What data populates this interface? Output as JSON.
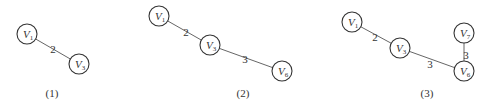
{
  "figures": [
    {
      "caption": "(1)",
      "caption_pos": [
        52,
        97
      ],
      "nodes": [
        {
          "id": "V1",
          "letter": "V",
          "sub": "1",
          "x": 27,
          "y": 34
        },
        {
          "id": "V3",
          "letter": "V",
          "sub": "3",
          "x": 79,
          "y": 64
        }
      ],
      "edges": [
        {
          "from": "V1",
          "to": "V3",
          "weight": "2",
          "lx": 53,
          "ly": 49
        }
      ]
    },
    {
      "caption": "(2)",
      "caption_pos": [
        243,
        97
      ],
      "nodes": [
        {
          "id": "V1",
          "letter": "V",
          "sub": "1",
          "x": 159,
          "y": 16
        },
        {
          "id": "V3",
          "letter": "V",
          "sub": "3",
          "x": 210,
          "y": 45
        },
        {
          "id": "V6",
          "letter": "V",
          "sub": "6",
          "x": 282,
          "y": 71
        }
      ],
      "edges": [
        {
          "from": "V1",
          "to": "V3",
          "weight": "2",
          "lx": 186,
          "ly": 32
        },
        {
          "from": "V3",
          "to": "V6",
          "weight": "3",
          "lx": 245,
          "ly": 59
        }
      ]
    },
    {
      "caption": "(3)",
      "caption_pos": [
        427,
        97
      ],
      "nodes": [
        {
          "id": "V1",
          "letter": "V",
          "sub": "1",
          "x": 352,
          "y": 22
        },
        {
          "id": "V3",
          "letter": "V",
          "sub": "3",
          "x": 400,
          "y": 48
        },
        {
          "id": "V7",
          "letter": "V",
          "sub": "7",
          "x": 464,
          "y": 33
        },
        {
          "id": "V6",
          "letter": "V",
          "sub": "6",
          "x": 464,
          "y": 71
        }
      ],
      "edges": [
        {
          "from": "V1",
          "to": "V3",
          "weight": "2",
          "lx": 375,
          "ly": 37
        },
        {
          "from": "V3",
          "to": "V6",
          "weight": "3",
          "lx": 430,
          "ly": 64
        },
        {
          "from": "V6",
          "to": "V7",
          "weight": "3",
          "lx": 466,
          "ly": 55
        }
      ]
    }
  ],
  "style": {
    "node_radius": 10,
    "stroke_color": "#333333",
    "edge_color": "#555555",
    "background": "#ffffff"
  }
}
